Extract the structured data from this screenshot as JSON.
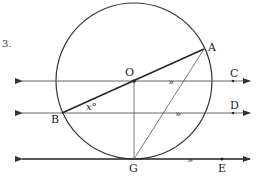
{
  "problem_number": "3.",
  "labels": {
    "A": "A",
    "B": "B",
    "C": "C",
    "D": "D",
    "E": "E",
    "G": "G",
    "O": "O"
  },
  "angle_label": "x°",
  "parallel_mark": "»",
  "colors": {
    "stroke": "#222222",
    "thin": "#555555",
    "background": "#ffffff"
  }
}
